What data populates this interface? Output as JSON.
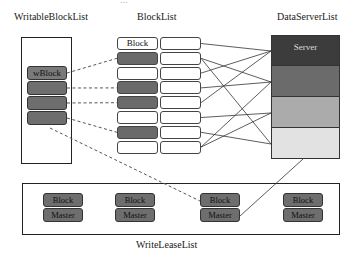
{
  "caption_partial": "...",
  "labels": {
    "writable": "WritableBlockList",
    "blocklist": "BlockList",
    "dataserver": "DataServerList",
    "writelease": "WriteLeaseList"
  },
  "writable_blocks": [
    {
      "label": "wBlock"
    },
    {
      "label": ""
    },
    {
      "label": ""
    },
    {
      "label": ""
    }
  ],
  "block_list": {
    "left": [
      {
        "label": "Block",
        "dark": false
      },
      {
        "label": "",
        "dark": true
      },
      {
        "label": "",
        "dark": false
      },
      {
        "label": "",
        "dark": true
      },
      {
        "label": "",
        "dark": true
      },
      {
        "label": "",
        "dark": false
      },
      {
        "label": "",
        "dark": true
      },
      {
        "label": "",
        "dark": false
      }
    ],
    "right_count": 8
  },
  "data_servers": [
    {
      "label": "Server",
      "color": "#3c3c3c"
    },
    {
      "label": "",
      "color": "#6b6b6b"
    },
    {
      "label": "",
      "color": "#ababab"
    },
    {
      "label": "",
      "color": "#e2e2e2"
    }
  ],
  "write_leases": [
    {
      "block": "Block",
      "master": "Master"
    },
    {
      "block": "Block",
      "master": "Master"
    },
    {
      "block": "Block",
      "master": "Master"
    },
    {
      "block": "Block",
      "master": "Master"
    }
  ],
  "connections": {
    "writable_to_blocklist": [
      [
        0,
        1
      ],
      [
        1,
        3
      ],
      [
        2,
        4
      ],
      [
        3,
        6
      ]
    ],
    "blocklist_to_server": [
      [
        0,
        0
      ],
      [
        1,
        1
      ],
      [
        1,
        3
      ],
      [
        2,
        0
      ],
      [
        3,
        1
      ],
      [
        4,
        0
      ],
      [
        5,
        2
      ],
      [
        6,
        3
      ],
      [
        7,
        2
      ],
      [
        7,
        1
      ]
    ],
    "writable_to_lease": [
      2
    ],
    "server_to_lease": [
      2
    ]
  }
}
